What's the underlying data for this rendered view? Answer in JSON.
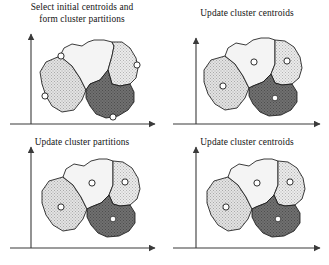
{
  "figure": {
    "kind": "k-means-clustering-illustration",
    "width": 329,
    "height": 265,
    "background": "#ffffff",
    "stroke_color": "#1a1a1a",
    "axis_color": "#3a3a3a"
  },
  "panels": [
    {
      "id": "panel-select-initial-centroids",
      "title": "Select initial centroids and\nform cluster partitions",
      "position": "top-left",
      "centroid_placement": "on-boundary",
      "centroid_marker": "open-circle",
      "clusters": [
        {
          "name": "cluster-left",
          "fill": "#d7d7d7",
          "pattern": "fine-stipple",
          "centroid": {
            "x": 31,
            "y": 80
          }
        },
        {
          "name": "cluster-top",
          "fill": "#f5f5f5",
          "pattern": "plain-light",
          "centroid": {
            "x": 58,
            "y": 22
          }
        },
        {
          "name": "cluster-right",
          "fill": "#dedede",
          "pattern": "fine-stipple",
          "centroid": {
            "x": 118,
            "y": 38
          }
        },
        {
          "name": "cluster-bottom",
          "fill": "#6e6e6e",
          "pattern": "dark-stipple",
          "centroid": {
            "x": 86,
            "y": 96
          }
        }
      ]
    },
    {
      "id": "panel-update-cluster-centroids-1",
      "title": "Update cluster centroids",
      "position": "top-right",
      "centroid_placement": "interior",
      "centroid_marker": "open-circle",
      "clusters": [
        {
          "name": "cluster-left",
          "fill": "#d7d7d7",
          "pattern": "fine-stipple",
          "centroid": {
            "x": 30,
            "y": 79
          }
        },
        {
          "name": "cluster-top",
          "fill": "#f3f3f3",
          "pattern": "plain-light",
          "centroid": {
            "x": 62,
            "y": 48
          }
        },
        {
          "name": "cluster-right",
          "fill": "#dedede",
          "pattern": "fine-stipple",
          "centroid": {
            "x": 104,
            "y": 47
          }
        },
        {
          "name": "cluster-bottom",
          "fill": "#6e6e6e",
          "pattern": "dark-stipple",
          "centroid": {
            "x": 84,
            "y": 88
          }
        }
      ]
    },
    {
      "id": "panel-update-cluster-partitions",
      "title": "Update cluster partitions",
      "position": "bottom-left",
      "centroid_placement": "interior",
      "centroid_marker": "open-circle",
      "clusters": [
        {
          "name": "cluster-left",
          "fill": "#d7d7d7",
          "pattern": "fine-stipple",
          "centroid": {
            "x": 30,
            "y": 79
          }
        },
        {
          "name": "cluster-top",
          "fill": "#f3f3f3",
          "pattern": "plain-light",
          "centroid": {
            "x": 62,
            "y": 48
          }
        },
        {
          "name": "cluster-right",
          "fill": "#dedede",
          "pattern": "fine-stipple",
          "centroid": {
            "x": 104,
            "y": 47
          }
        },
        {
          "name": "cluster-bottom",
          "fill": "#6e6e6e",
          "pattern": "dark-stipple",
          "centroid": {
            "x": 84,
            "y": 88
          }
        }
      ]
    },
    {
      "id": "panel-update-cluster-centroids-2",
      "title": "Update cluster centroids",
      "position": "bottom-right",
      "centroid_placement": "interior",
      "centroid_marker": "open-circle",
      "clusters": [
        {
          "name": "cluster-left",
          "fill": "#d7d7d7",
          "pattern": "fine-stipple",
          "centroid": {
            "x": 30,
            "y": 79
          }
        },
        {
          "name": "cluster-top",
          "fill": "#f3f3f3",
          "pattern": "plain-light",
          "centroid": {
            "x": 62,
            "y": 48
          }
        },
        {
          "name": "cluster-right",
          "fill": "#dedede",
          "pattern": "fine-stipple",
          "centroid": {
            "x": 104,
            "y": 47
          }
        },
        {
          "name": "cluster-bottom",
          "fill": "#6e6e6e",
          "pattern": "dark-stipple",
          "centroid": {
            "x": 84,
            "y": 88
          }
        }
      ]
    }
  ],
  "axes": {
    "x_axis_name": "x-axis-arrow",
    "y_axis_name": "y-axis-arrow",
    "arrowheads": true,
    "tick_labels": []
  }
}
